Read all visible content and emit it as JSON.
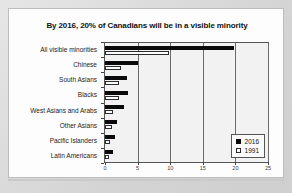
{
  "slide": {
    "title": "By 2016, 20% of Canadians will be in a visible minority"
  },
  "legend": {
    "position": "inside-bottom-right",
    "items": [
      {
        "label": "2016",
        "swatch": "filled-square-icon",
        "color": "#000000"
      },
      {
        "label": "1991",
        "swatch": "hollow-square-icon",
        "color": "#ffffff"
      }
    ]
  },
  "chart_data": {
    "type": "bar",
    "orientation": "horizontal",
    "title": "By 2016, 20% of Canadians will be in a visible minority",
    "xlabel": "",
    "ylabel": "",
    "xlim": [
      0,
      25
    ],
    "xticks": [
      "0",
      "5",
      "10",
      "15",
      "20",
      "25"
    ],
    "xtick_values": [
      0,
      5,
      10,
      15,
      20,
      25
    ],
    "grid": true,
    "legend_position": "lower right",
    "categories": [
      "All visible minorities",
      "Chinese",
      "South Asians",
      "Blacks",
      "West Asians and Arabs",
      "Other Asians",
      "Pacific Islanders",
      "Latin Americans"
    ],
    "series": [
      {
        "name": "2016",
        "color": "#000000",
        "values": [
          19.8,
          5.1,
          3.3,
          3.6,
          2.9,
          1.8,
          1.6,
          1.2
        ]
      },
      {
        "name": "1991",
        "color": "#ffffff",
        "values": [
          9.8,
          2.4,
          2.1,
          2.1,
          1.2,
          1.0,
          0.7,
          0.6
        ]
      }
    ]
  }
}
